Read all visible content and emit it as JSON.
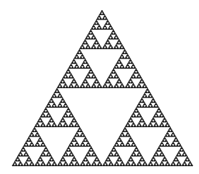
{
  "figure": {
    "background": "#ffffff",
    "fill_color": "#1a1a1a",
    "depth": 6,
    "apex": [
      102,
      10
    ],
    "base_left": [
      12,
      166
    ],
    "base_right": [
      193,
      166
    ]
  }
}
